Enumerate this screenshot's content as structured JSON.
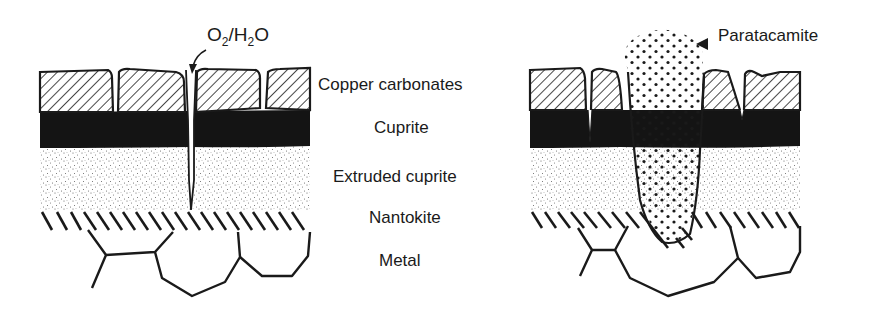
{
  "figure": {
    "left_panel": {
      "name": "initial corrosion stratigraphy",
      "annotation": {
        "formula_parts": [
          "O",
          "2",
          "/H",
          "2",
          "O"
        ],
        "text": "O2/H2O"
      }
    },
    "right_panel": {
      "name": "paratacamite eruption",
      "annotation": {
        "text": "Paratacamite"
      }
    },
    "layers": [
      {
        "label": "Copper carbonates",
        "pattern": "diagonal-hatch"
      },
      {
        "label": "Cuprite",
        "pattern": "solid-black"
      },
      {
        "label": "Extruded cuprite",
        "pattern": "fine-stipple"
      },
      {
        "label": "Nantokite",
        "pattern": "short-diagonal-strokes"
      },
      {
        "label": "Metal",
        "pattern": "grain-boundaries"
      }
    ],
    "colors": {
      "ink": "#1a1a1a",
      "background": "#ffffff"
    }
  }
}
